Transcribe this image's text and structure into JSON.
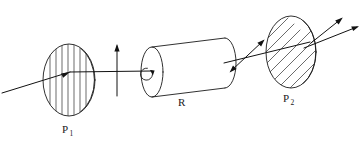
{
  "figure": {
    "background_color": "#ffffff",
    "line_color": "#1a1a1a",
    "width": 362,
    "height": 145
  },
  "labels": {
    "polarizer1": {
      "base": "P",
      "subscript": "1",
      "full": "P1"
    },
    "medium": {
      "base": "R",
      "subscript": "",
      "full": "R"
    },
    "polarizer2": {
      "base": "P",
      "subscript": "2",
      "full": "P2"
    }
  },
  "elements": {
    "incident_ray": {
      "name": "incident-light-ray",
      "description": "ray entering from lower left"
    },
    "polarizer1_disc": {
      "name": "polarizer-p1",
      "hatching": "vertical",
      "hatch_count": 7
    },
    "vertical_polarization_arrow": {
      "name": "vertical-polarization-arrow",
      "direction": "up"
    },
    "rotatory_cylinder": {
      "name": "rotatory-medium-cylinder",
      "rotation_arrow": "counterclockwise-loop"
    },
    "rotated_polarization_arrow": {
      "name": "rotated-polarization-arrow",
      "direction": "up-right-diagonal"
    },
    "polarizer2_disc": {
      "name": "analyzer-p2",
      "hatching": "diagonal",
      "hatch_count": 12
    },
    "exit_rays": {
      "name": "transmitted-rays",
      "count": 2
    }
  }
}
